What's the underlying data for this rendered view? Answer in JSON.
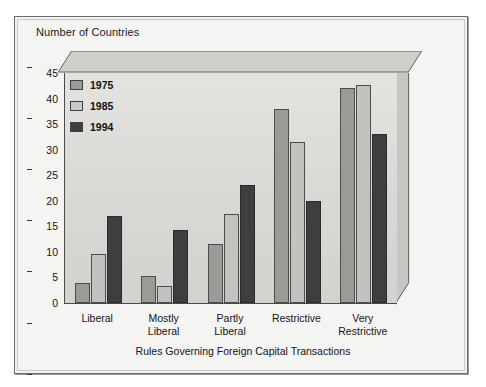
{
  "figure": {
    "y_caption": "Number of Countries",
    "x_title": "Rules Governing Foreign Capital Transactions"
  },
  "legend": {
    "position": "inside-top-left",
    "items": [
      {
        "label": "1975",
        "color": "#9a9a96"
      },
      {
        "label": "1985",
        "color": "#c8c8c4"
      },
      {
        "label": "1994",
        "color": "#3e3e40"
      }
    ]
  },
  "axis": {
    "y_ticks": [
      "0",
      "5",
      "10",
      "15",
      "20",
      "25",
      "30",
      "35",
      "40",
      "45"
    ],
    "y_min": 0,
    "y_max": 45
  },
  "chart_data": {
    "type": "bar",
    "title": "",
    "subtitle": "",
    "xlabel": "Rules Governing Foreign Capital Transactions",
    "ylabel": "Number of Countries",
    "ylim": [
      0,
      45
    ],
    "ytick_step": 5,
    "grid": false,
    "legend_position": "inside-top-left",
    "categories": [
      "Liberal",
      "Mostly\nLiberal",
      "Partly\nLiberal",
      "Restrictive",
      "Very\nRestrictive"
    ],
    "series": [
      {
        "name": "1975",
        "color": "#9a9a96",
        "values": [
          4,
          5.3,
          11.5,
          38,
          42
        ]
      },
      {
        "name": "1985",
        "color": "#c8c8c4",
        "values": [
          9.5,
          3.3,
          17.5,
          31.5,
          42.7
        ]
      },
      {
        "name": "1994",
        "color": "#3e3e40",
        "values": [
          17,
          14.3,
          23,
          20,
          33
        ]
      }
    ]
  }
}
